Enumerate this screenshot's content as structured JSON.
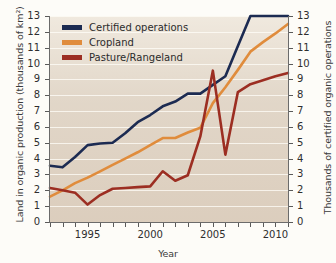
{
  "chart_data": {
    "type": "line",
    "title": "",
    "xlabel": "Year",
    "ylabel": "Land in organic production (thousands of km²)",
    "ylabel_right": "Thousands of certified organic operations",
    "xlim": [
      1992,
      2011
    ],
    "ylim": [
      0,
      13
    ],
    "ylim_right": [
      0,
      13
    ],
    "grid": true,
    "legend_position": "top-left",
    "x": [
      1992,
      1993,
      1994,
      1995,
      1996,
      1997,
      1998,
      1999,
      2000,
      2001,
      2002,
      2003,
      2004,
      2005,
      2006,
      2007,
      2008,
      2009,
      2010,
      2011
    ],
    "xticks": [
      1992,
      1993,
      1994,
      1995,
      1996,
      1997,
      1998,
      1999,
      2000,
      2001,
      2002,
      2003,
      2004,
      2005,
      2006,
      2007,
      2008,
      2009,
      2010,
      2011
    ],
    "xtick_labels": [
      "",
      "",
      "",
      "1995",
      "",
      "",
      "",
      "",
      "2000",
      "",
      "",
      "",
      "",
      "2005",
      "",
      "",
      "",
      "",
      "2010",
      ""
    ],
    "yticks": [
      0,
      1,
      2,
      3,
      4,
      5,
      6,
      7,
      8,
      9,
      10,
      11,
      12,
      13
    ],
    "yticks_right": [
      0,
      1,
      2,
      3,
      4,
      5,
      6,
      7,
      8,
      9,
      10,
      11,
      12,
      13
    ],
    "series": [
      {
        "name": "Certified operations",
        "color": "#1c2b52",
        "axis": "right",
        "values": [
          3.55,
          3.45,
          4.1,
          4.85,
          4.95,
          5.0,
          5.6,
          6.3,
          6.75,
          7.3,
          7.6,
          8.1,
          8.1,
          8.65,
          9.2,
          11.1,
          13.0,
          13.0,
          13.0,
          13.0
        ]
      },
      {
        "name": "Cropland",
        "color": "#e08c3c",
        "axis": "left",
        "values": [
          1.6,
          2.0,
          2.45,
          2.8,
          3.2,
          3.6,
          4.0,
          4.4,
          4.85,
          5.3,
          5.3,
          5.65,
          5.95,
          7.5,
          8.5,
          9.6,
          10.75,
          11.35,
          11.9,
          12.5
        ]
      },
      {
        "name": "Pasture/Rangeland",
        "color": "#9c2e22",
        "axis": "left",
        "values": [
          2.15,
          2.0,
          1.85,
          1.1,
          1.7,
          2.1,
          2.15,
          2.2,
          2.25,
          3.2,
          2.6,
          2.95,
          5.4,
          9.55,
          4.25,
          8.2,
          8.7,
          8.95,
          9.2,
          9.4
        ]
      }
    ]
  },
  "legend": {
    "items": [
      {
        "label": "Certified operations",
        "color": "#1c2b52"
      },
      {
        "label": "Cropland",
        "color": "#e08c3c"
      },
      {
        "label": "Pasture/Rangeland",
        "color": "#9c2e22"
      }
    ]
  },
  "axes": {
    "left_title": "Land in organic production (thousands of km²)",
    "right_title": "Thousands of certified organic operations",
    "x_title": "Year"
  }
}
